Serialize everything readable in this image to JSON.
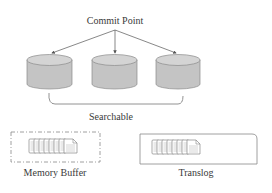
{
  "diagram": {
    "commit_point_label": "Commit Point",
    "segments": [
      {
        "name": "segment-1",
        "icon": "database-cylinder-icon"
      },
      {
        "name": "segment-2",
        "icon": "database-cylinder-icon"
      },
      {
        "name": "segment-3",
        "icon": "database-cylinder-icon"
      }
    ],
    "searchable_label": "Searchable",
    "memory_buffer": {
      "label": "Memory Buffer",
      "icon": "document-stack-icon",
      "border": "dashed"
    },
    "translog": {
      "label": "Translog",
      "icon": "document-stack-icon",
      "border": "solid"
    },
    "colors": {
      "cylinder_fill": "#c4c4c4",
      "cylinder_top": "#d6d6d6",
      "stroke": "#7a7a7a",
      "text": "#3a3a3a"
    }
  }
}
